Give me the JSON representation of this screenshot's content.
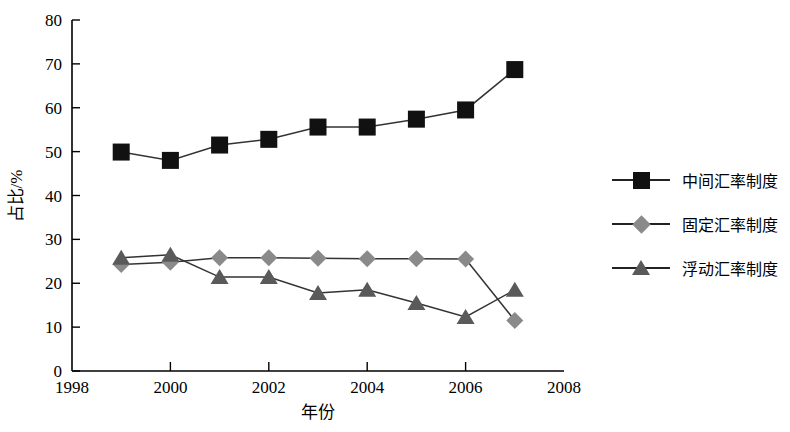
{
  "chart_data": {
    "type": "line",
    "title": "",
    "xlabel": "年份",
    "ylabel": "占比/%",
    "xlim": [
      1998,
      2008
    ],
    "ylim": [
      0,
      80
    ],
    "xticks": [
      "1998",
      "2000",
      "2002",
      "2004",
      "2006",
      "2008"
    ],
    "xtick_values": [
      1998,
      2000,
      2002,
      2004,
      2006,
      2008
    ],
    "yticks": [
      "0",
      "10",
      "20",
      "30",
      "40",
      "50",
      "60",
      "70",
      "80"
    ],
    "ytick_values": [
      0,
      10,
      20,
      30,
      40,
      50,
      60,
      70,
      80
    ],
    "grid": false,
    "legend_position": "right",
    "x": [
      1999,
      2000,
      2001,
      2002,
      2003,
      2004,
      2005,
      2006,
      2007
    ],
    "series": [
      {
        "name": "中间汇率制度",
        "marker": "square",
        "color": "#111111",
        "values": [
          49.9,
          48.0,
          51.5,
          52.8,
          55.6,
          55.6,
          57.4,
          59.5,
          68.7
        ]
      },
      {
        "name": "固定汇率制度",
        "marker": "diamond",
        "color": "#8a8a8a",
        "values": [
          24.3,
          24.8,
          25.8,
          25.8,
          25.7,
          25.6,
          25.6,
          25.5,
          11.5
        ]
      },
      {
        "name": "浮动汇率制度",
        "marker": "triangle",
        "color": "#5a5a5a",
        "values": [
          25.8,
          26.5,
          21.4,
          21.4,
          17.8,
          18.5,
          15.5,
          12.3,
          18.5
        ]
      }
    ]
  },
  "legend": {
    "items": [
      {
        "label": "中间汇率制度"
      },
      {
        "label": "固定汇率制度"
      },
      {
        "label": "浮动汇率制度"
      }
    ]
  },
  "axes": {
    "x_title": "年份",
    "y_title": "占比/%"
  }
}
